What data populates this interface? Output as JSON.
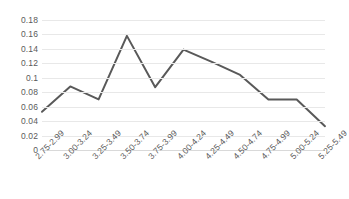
{
  "chart_data": {
    "type": "line",
    "title": "",
    "subtitle": "",
    "xlabel": "",
    "ylabel": "",
    "categories": [
      "2.75-2.99",
      "3.00-3.24",
      "3.25-3.49",
      "3.50-3.74",
      "3.75-3.99",
      "4.00-4.24",
      "4.25-4.49",
      "4.50-4.74",
      "4.75-4.99",
      "5.00-5.24",
      "5.25-5.49"
    ],
    "values": [
      0.053,
      0.088,
      0.07,
      0.158,
      0.087,
      0.139,
      0.122,
      0.104,
      0.07,
      0.07,
      0.033
    ],
    "series": [
      {
        "name": "Series 1",
        "values": [
          0.053,
          0.088,
          0.07,
          0.158,
          0.087,
          0.139,
          0.122,
          0.104,
          0.07,
          0.07,
          0.033
        ],
        "color": "#595959"
      }
    ],
    "ylim": [
      0,
      0.18
    ],
    "y_ticks": [
      0,
      0.02,
      0.04,
      0.06,
      0.08,
      0.1,
      0.12,
      0.14,
      0.16,
      0.18
    ],
    "y_tick_labels": [
      "0",
      "0.02",
      "0.04",
      "0.06",
      "0.08",
      "0.1",
      "0.12",
      "0.14",
      "0.16",
      "0.18"
    ],
    "grid": true,
    "grid_color": "#e8e8e8",
    "legend": false,
    "legend_position": "none",
    "markers": false,
    "line_width": 2,
    "background": "#ffffff",
    "x_tick_rotation": -45
  }
}
